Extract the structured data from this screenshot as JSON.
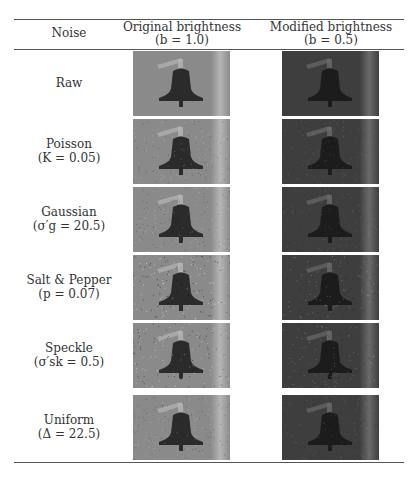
{
  "table": {
    "headers": {
      "noise": "Noise",
      "original": "Original brightness",
      "original_param": "(b = 1.0)",
      "modified": "Modified brightness",
      "modified_param": "(b = 0.5)"
    },
    "rows": [
      {
        "name": "Raw",
        "param": ""
      },
      {
        "name": "Poisson",
        "param": "(K = 0.05)"
      },
      {
        "name": "Gaussian",
        "param": "(σ′g = 20.5)"
      },
      {
        "name": "Salt & Pepper",
        "param": "(p = 0.07)"
      },
      {
        "name": "Speckle",
        "param": "(σ′sk = 0.5)"
      },
      {
        "name": "Uniform",
        "param": "(Δ = 22.5)"
      }
    ],
    "image_subject": "bell photograph",
    "colors": {
      "original_bg": "#8a8a8a",
      "modified_bg": "#3e3e3e",
      "bell_original": "#2b2b2b",
      "bell_modified": "#1c1c1c"
    }
  }
}
